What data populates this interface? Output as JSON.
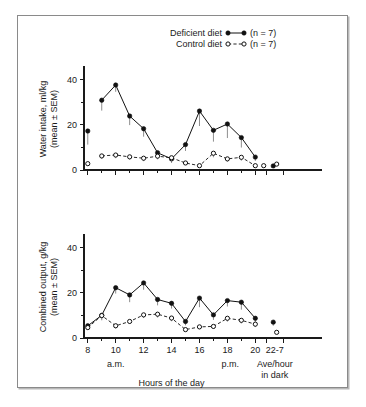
{
  "figure": {
    "xlabel": "Hours of the day",
    "period_labels": {
      "am": "a.m.",
      "pm": "p.m.",
      "dark_line1": "Ave/hour",
      "dark_line2": "in dark"
    },
    "legend": {
      "deficient_label": "Deficient diet",
      "deficient_n": "(n = 7)",
      "control_label": "Control diet",
      "control_n": "(n = 7)"
    },
    "colors": {
      "ink": "#111111",
      "error_bar": "#8d8d8d",
      "frame": "#8a8a8a",
      "background": "#ffffff"
    }
  },
  "chart_data": [
    {
      "type": "line",
      "panel": "top",
      "title": "",
      "ylabel": "Water intake, ml/kg (mean ± SEM)",
      "ylabel_line1": "Water intake, ml/kg",
      "ylabel_line2": "(mean ± SEM)",
      "xlabel": "Hours of the day",
      "ylim": [
        0,
        45
      ],
      "yticks": [
        0,
        20,
        40
      ],
      "yticks_minor": [
        10,
        30
      ],
      "xticks": [
        8,
        9,
        10,
        11,
        12,
        13,
        14,
        15,
        16,
        17,
        18,
        19,
        20
      ],
      "xtick_labels": [
        "8",
        "",
        "10",
        "",
        "12",
        "",
        "14",
        "",
        "16",
        "",
        "18",
        "",
        "20"
      ],
      "x_extra_label": "22-7",
      "grid": false,
      "legend_position": "top-right",
      "series": [
        {
          "name": "Deficient diet",
          "marker": "filled-circle",
          "linestyle": "solid",
          "x": [
            8,
            9,
            10,
            11,
            12,
            13,
            14,
            15,
            16,
            17,
            18,
            19,
            20
          ],
          "values": [
            17.2,
            30.8,
            37.5,
            23.8,
            18.2,
            7.6,
            4.9,
            11.2,
            26.0,
            17.5,
            20.3,
            14.3,
            5.7
          ],
          "sem": [
            6.0,
            4.6,
            3.0,
            4.0,
            3.5,
            2.4,
            1.8,
            2.8,
            6.6,
            5.0,
            6.2,
            4.4,
            1.7
          ],
          "connected_from_first": false,
          "dark_average": {
            "x_label": "22-7",
            "value": 1.8,
            "sem": 0.8
          }
        },
        {
          "name": "Control diet",
          "marker": "open-circle",
          "linestyle": "dashed",
          "x": [
            8,
            9,
            10,
            11,
            12,
            13,
            14,
            15,
            16,
            17,
            18,
            19,
            20
          ],
          "values": [
            2.8,
            6.2,
            6.6,
            5.8,
            5.2,
            6.1,
            5.4,
            3.1,
            1.9,
            7.4,
            4.9,
            5.6,
            1.9
          ],
          "sem": [
            0.9,
            1.3,
            1.4,
            1.2,
            1.3,
            1.4,
            1.4,
            0.9,
            0.7,
            1.8,
            1.2,
            1.5,
            0.6
          ],
          "connected_from_first": false,
          "extra_point": {
            "x": 20.6,
            "value": 1.9
          },
          "dark_average": {
            "x_label": "22-7",
            "value": 2.6,
            "sem": 0.6
          }
        }
      ]
    },
    {
      "type": "line",
      "panel": "bottom",
      "title": "",
      "ylabel": "Combined output, g/kg (mean ± SEM)",
      "ylabel_line1": "Combined output, g/kg",
      "ylabel_line2": "(mean ± SEM)",
      "xlabel": "Hours of the day",
      "ylim": [
        0,
        45
      ],
      "yticks": [
        0,
        20,
        40
      ],
      "yticks_minor": [
        10,
        30
      ],
      "xticks": [
        8,
        9,
        10,
        11,
        12,
        13,
        14,
        15,
        16,
        17,
        18,
        19,
        20
      ],
      "xtick_labels": [
        "8",
        "",
        "10",
        "",
        "12",
        "",
        "14",
        "",
        "16",
        "",
        "18",
        "",
        "20"
      ],
      "x_extra_label": "22-7",
      "grid": false,
      "legend_position": "none",
      "series": [
        {
          "name": "Deficient diet",
          "marker": "filled-circle",
          "linestyle": "solid",
          "x": [
            8,
            9,
            10,
            11,
            12,
            13,
            14,
            15,
            16,
            17,
            18,
            19,
            20
          ],
          "values": [
            5.4,
            10.0,
            22.2,
            19.0,
            24.3,
            17.0,
            15.3,
            7.3,
            17.6,
            10.2,
            16.5,
            15.8,
            8.7
          ],
          "sem": [
            1.1,
            2.2,
            2.6,
            3.2,
            3.0,
            2.6,
            2.3,
            1.7,
            4.0,
            2.2,
            2.6,
            3.3,
            1.9
          ],
          "connected_from_first": true,
          "dark_average": {
            "x_label": "22-7",
            "value": 7.0,
            "sem": 1.6
          }
        },
        {
          "name": "Control diet",
          "marker": "open-circle",
          "linestyle": "dashed",
          "x": [
            8,
            9,
            10,
            11,
            12,
            13,
            14,
            15,
            16,
            17,
            18,
            19,
            20
          ],
          "values": [
            4.6,
            9.9,
            5.4,
            7.3,
            10.2,
            10.5,
            8.8,
            3.7,
            4.9,
            5.1,
            8.7,
            7.8,
            6.1
          ],
          "sem": [
            0.9,
            1.6,
            1.2,
            1.1,
            1.4,
            1.5,
            1.4,
            0.8,
            1.0,
            1.1,
            1.5,
            1.4,
            1.3
          ],
          "connected_from_first": true,
          "dark_average": {
            "x_label": "22-7",
            "value": 2.5,
            "sem": 0.5
          }
        }
      ]
    }
  ]
}
